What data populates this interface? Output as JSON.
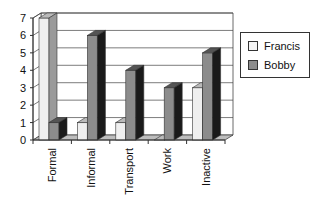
{
  "chart_data": {
    "type": "bar",
    "style": "3d-clustered-column",
    "title": "",
    "xlabel": "",
    "ylabel": "",
    "categories": [
      "Formal",
      "Informal",
      "Transport",
      "Work",
      "Inactive"
    ],
    "series": [
      {
        "name": "Francis",
        "values": [
          7,
          1,
          1,
          0,
          3
        ],
        "color": "#efefef"
      },
      {
        "name": "Bobby",
        "values": [
          1,
          6,
          4,
          3,
          5
        ],
        "color": "#8c8c8c"
      }
    ],
    "yticks": [
      "0",
      "1",
      "2",
      "3",
      "4",
      "5",
      "6",
      "7"
    ],
    "ylim": [
      0,
      7
    ],
    "grid": true,
    "legend_position": "right"
  },
  "legend": {
    "items": [
      {
        "label": "Francis",
        "color": "#efefef"
      },
      {
        "label": "Bobby",
        "color": "#8c8c8c"
      }
    ]
  }
}
